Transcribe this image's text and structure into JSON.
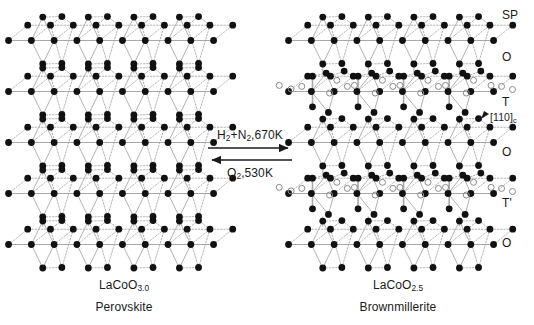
{
  "figure": {
    "background": "#ffffff",
    "atom_color": "#111111",
    "vacancy_stroke": "#8a8a8a",
    "bond_color": "#a8a8a8",
    "text_color": "#1a1a1a"
  },
  "reaction": {
    "forward_label": "H2+N2,670K",
    "forward_html": "H<sub>2</sub>+N<sub>2</sub>,670K",
    "reverse_label": "O2,530K",
    "reverse_html": "O<sub>2</sub>,530K",
    "forward_direction": "right",
    "reverse_direction": "left"
  },
  "left_structure": {
    "name": "perovskite-lattice",
    "formula_label": "LaCoO3.0",
    "formula_html": "LaCoO<sub>3.0</sub>",
    "phase_name": "Perovskite",
    "bounds": {
      "x": 12,
      "y": 14,
      "width": 205,
      "height": 255
    },
    "layer_count": 5,
    "columns": 4,
    "layer_types": [
      "O",
      "O",
      "O",
      "O",
      "O"
    ],
    "has_vacancies": false
  },
  "right_structure": {
    "name": "brownmillerite-lattice",
    "formula_label": "LaCoO2.5",
    "formula_html": "LaCoO<sub>2.5</sub>",
    "phase_name": "Brownmillerite",
    "bounds": {
      "x": 292,
      "y": 14,
      "width": 205,
      "height": 255
    },
    "layer_count": 5,
    "columns": 4,
    "layer_types": [
      "O",
      "T",
      "O",
      "T'",
      "O"
    ],
    "has_vacancies": true
  },
  "side_labels": [
    {
      "id": "sp",
      "text": "SP",
      "x": 502,
      "y": 8
    },
    {
      "id": "o-1",
      "text": "O",
      "x": 502,
      "y": 50
    },
    {
      "id": "t",
      "text": "T",
      "x": 502,
      "y": 95
    },
    {
      "id": "o-2",
      "text": "O",
      "x": 502,
      "y": 145
    },
    {
      "id": "t-prime",
      "text": "T'",
      "x": 502,
      "y": 196
    },
    {
      "id": "o-3",
      "text": "O",
      "x": 502,
      "y": 236
    }
  ],
  "axis_label": {
    "text": "[110]c",
    "text_html": "[110]<sub>c</sub>",
    "x": 490,
    "y": 111
  },
  "captions": {
    "left_formula_x": 124,
    "left_name_x": 124,
    "right_formula_x": 398,
    "right_name_x": 398,
    "formula_y": 278,
    "name_y": 300
  }
}
